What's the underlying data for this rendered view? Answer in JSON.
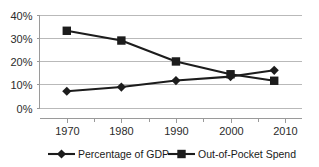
{
  "chart_data": {
    "type": "line",
    "title": "",
    "subtitle": "",
    "xlabel": "",
    "ylabel": "",
    "x": [
      1970,
      1980,
      1990,
      2000,
      2008
    ],
    "xlim": [
      1965,
      2013
    ],
    "ylim": [
      0,
      40
    ],
    "grid": "horizontal",
    "legend_position": "bottom",
    "xticks": [
      "1970",
      "1980",
      "1990",
      "2000",
      "2010"
    ],
    "xtick_values": [
      1970,
      1980,
      1990,
      2000,
      2010
    ],
    "yticks": [
      "0%",
      "10%",
      "20%",
      "30%",
      "40%"
    ],
    "ytick_values": [
      0,
      10,
      20,
      30,
      40
    ],
    "series": [
      {
        "name": "Percentage of GDP",
        "marker": "diamond",
        "color": "#1c1c1c",
        "values": [
          7.0,
          8.8,
          11.6,
          13.3,
          16.0
        ]
      },
      {
        "name": "Out-of-Pocket Spend",
        "marker": "square",
        "color": "#1c1c1c",
        "values": [
          33.0,
          28.8,
          19.8,
          14.3,
          11.5
        ]
      }
    ]
  },
  "legend": {
    "items": [
      {
        "label": "Percentage of GDP",
        "marker": "diamond"
      },
      {
        "label": "Out-of-Pocket Spend",
        "marker": "square"
      }
    ]
  },
  "axes": {
    "y_labels": [
      "40%",
      "30%",
      "20%",
      "10%",
      "0%"
    ],
    "x_labels": [
      "1970",
      "1980",
      "1990",
      "2000",
      "2010"
    ]
  }
}
